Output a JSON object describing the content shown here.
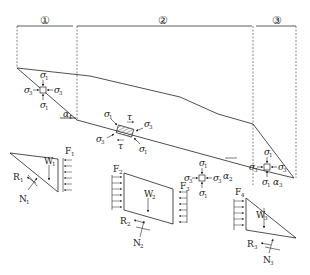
{
  "figure": {
    "type": "slope stability / landslide block force diagram",
    "zones": [
      {
        "id": "zone-1",
        "label": "①"
      },
      {
        "id": "zone-2",
        "label": "②"
      },
      {
        "id": "zone-3",
        "label": "③"
      }
    ],
    "stress_elements": [
      {
        "id": "element-1",
        "labels": {
          "top": "σ",
          "top_sub": "1",
          "bottom": "σ",
          "bottom_sub": "1",
          "left": "σ",
          "left_sub": "3",
          "right": "σ",
          "right_sub": "3"
        },
        "angle": "α",
        "angle_sub": "1"
      },
      {
        "id": "element-shear",
        "labels": {
          "s1a": "σ",
          "s1a_sub": "1",
          "s1b": "σ",
          "s1b_sub": "1",
          "s3a": "σ",
          "s3a_sub": "3",
          "s3b": "σ",
          "s3b_sub": "3",
          "tau_top": "τ",
          "tau_bottom": "τ"
        }
      },
      {
        "id": "element-2",
        "labels": {
          "top": "σ",
          "top_sub": "1",
          "bottom": "σ",
          "bottom_sub": "1",
          "left": "σ",
          "left_sub": "3",
          "right": "σ",
          "right_sub": "3"
        },
        "angle": "α",
        "angle_sub": "2"
      },
      {
        "id": "element-3",
        "labels": {
          "top": "σ",
          "top_sub": "1",
          "bottom": "σ",
          "bottom_sub": "1",
          "left": "σ",
          "left_sub": "3",
          "right": "σ",
          "right_sub": "3"
        },
        "angle": "α",
        "angle_sub": "3"
      }
    ],
    "free_bodies": [
      {
        "id": "block-1",
        "force": "F",
        "force_sub": "1",
        "weight": "W",
        "weight_sub": "1",
        "resistance": "R",
        "resistance_sub": "1",
        "normal": "N",
        "normal_sub": "1"
      },
      {
        "id": "block-2",
        "force_left": "F",
        "force_left_sub": "2",
        "force_right": "F",
        "force_right_sub": "3",
        "weight": "W",
        "weight_sub": "2",
        "resistance": "R",
        "resistance_sub": "2",
        "normal": "N",
        "normal_sub": "2"
      },
      {
        "id": "block-3",
        "force": "F",
        "force_sub": "4",
        "weight": "W",
        "weight_sub": "3",
        "resistance": "R",
        "resistance_sub": "3",
        "normal": "N",
        "normal_sub": "3"
      }
    ]
  }
}
